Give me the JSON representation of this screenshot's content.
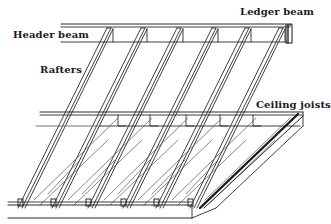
{
  "figure": {
    "type": "line-drawing",
    "stroke_color": "#2a2a2a",
    "background_color": "#ffffff"
  },
  "labels": {
    "ledger_beam": "Ledger beam",
    "header_beam": "Header beam",
    "rafters": "Rafters",
    "ceiling_joists": "Ceiling joists"
  },
  "components": {
    "rafter_count": 6,
    "ceiling_joist_count": 6
  }
}
